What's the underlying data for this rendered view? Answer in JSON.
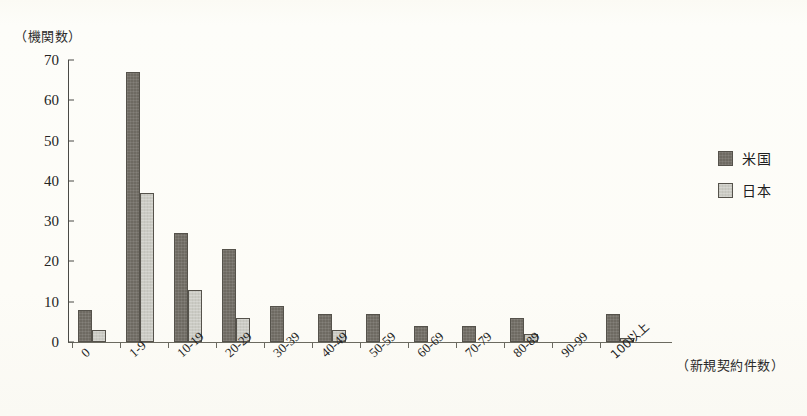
{
  "chart_data": {
    "type": "bar",
    "title": "",
    "subtitle": "",
    "ylabel": "（機関数）",
    "xlabel": "（新規契約件数）",
    "ylim": [
      0,
      70
    ],
    "y_ticks": [
      0,
      10,
      20,
      30,
      40,
      50,
      60,
      70
    ],
    "grid": false,
    "legend_position": "right",
    "categories": [
      "0",
      "1-9",
      "10-19",
      "20-29",
      "30-39",
      "40-49",
      "50-59",
      "60-69",
      "70-79",
      "80-89",
      "90-99",
      "100以上"
    ],
    "series": [
      {
        "name": "米国",
        "color": "#6e6a62",
        "values": [
          8,
          67,
          27,
          23,
          9,
          7,
          7,
          4,
          4,
          6,
          0,
          7
        ]
      },
      {
        "name": "日本",
        "color": "#cbcbc4",
        "values": [
          3,
          37,
          13,
          6,
          0,
          3,
          0,
          0,
          0,
          2,
          0,
          1
        ]
      }
    ]
  },
  "legend": {
    "items": [
      {
        "label": "米国",
        "key": "us"
      },
      {
        "label": "日本",
        "key": "jp"
      }
    ]
  }
}
